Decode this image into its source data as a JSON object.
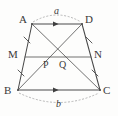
{
  "figure": {
    "kind": "geometry-diagram",
    "shape": "trapezoid",
    "background_color": "#fdfdfc",
    "stroke_color": "#4a4a4a",
    "dashed_color": "#8a8a8a",
    "text_color": "#3a3a3a",
    "vertices": [
      {
        "name": "A",
        "label": "A",
        "x": 32,
        "y": 24,
        "label_x": 19,
        "label_y": 16
      },
      {
        "name": "D",
        "label": "D",
        "x": 82,
        "y": 24,
        "label_x": 85,
        "label_y": 16
      },
      {
        "name": "B",
        "label": "B",
        "x": 18,
        "y": 90,
        "label_x": 4,
        "label_y": 88
      },
      {
        "name": "C",
        "label": "C",
        "x": 100,
        "y": 90,
        "label_x": 103,
        "label_y": 88
      }
    ],
    "midpoints": [
      {
        "name": "M",
        "label": "M",
        "x": 25,
        "y": 57,
        "label_x": 10,
        "label_y": 52
      },
      {
        "name": "N",
        "label": "N",
        "x": 91,
        "y": 57,
        "label_x": 94,
        "label_y": 52
      }
    ],
    "interior_points": [
      {
        "name": "P",
        "label": "P",
        "x": 47,
        "y": 57,
        "label_x": 43,
        "label_y": 62
      },
      {
        "name": "Q",
        "label": "Q",
        "x": 62,
        "y": 57,
        "label_x": 59,
        "label_y": 62
      }
    ],
    "segments": [
      {
        "name": "side-AD",
        "from": "A",
        "to": "D",
        "style": "solid",
        "marker": "single-arrow"
      },
      {
        "name": "side-BC",
        "from": "B",
        "to": "C",
        "style": "solid",
        "marker": "single-arrow"
      },
      {
        "name": "leg-AB",
        "from": "A",
        "to": "B",
        "style": "solid",
        "marker": "tick-pair"
      },
      {
        "name": "leg-DC",
        "from": "D",
        "to": "C",
        "style": "solid",
        "marker": "tick-pair"
      },
      {
        "name": "midline-MN",
        "from": "M",
        "to": "N",
        "style": "solid",
        "marker": "none"
      },
      {
        "name": "diagonal-AC",
        "from": "A",
        "to": "C",
        "style": "solid",
        "marker": "none"
      },
      {
        "name": "diagonal-BD",
        "from": "B",
        "to": "D",
        "style": "solid",
        "marker": "none"
      }
    ],
    "measures": [
      {
        "name": "top-base-measure",
        "label": "a",
        "position": "above-AD",
        "label_x": 54,
        "label_y": 10,
        "arc": "dashed"
      },
      {
        "name": "bottom-base-measure",
        "label": "b",
        "position": "below-BC",
        "label_x": 56,
        "label_y": 101,
        "arc": "dashed"
      }
    ],
    "annotations": {
      "parallel_marks": "AD and BC each carry one arrowhead indicating they are parallel",
      "congruence_ticks": "AM=MB and DN=NC marked with single ticks"
    }
  }
}
